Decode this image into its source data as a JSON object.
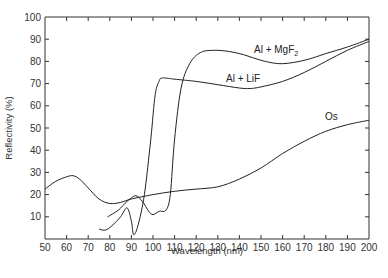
{
  "chart_data": {
    "type": "line",
    "title": "",
    "xlabel": "Wavelength (nm)",
    "ylabel": "Reflectivity (%)",
    "xlim": [
      50,
      200
    ],
    "ylim": [
      0,
      100
    ],
    "xticks": [
      50,
      60,
      70,
      80,
      90,
      100,
      110,
      120,
      130,
      140,
      150,
      160,
      170,
      180,
      190,
      200
    ],
    "yticks": [
      10,
      20,
      30,
      40,
      50,
      60,
      70,
      80,
      90,
      100
    ],
    "grid": false,
    "legend": "inline labels",
    "series": [
      {
        "name": "Al + MgF2",
        "label_text": "Al + MgF",
        "label_subscript": "2",
        "x": [
          79,
          84,
          88,
          92,
          95,
          98,
          100,
          103,
          106,
          108,
          110,
          113,
          117,
          122,
          128,
          135,
          142,
          150,
          158,
          165,
          172,
          180,
          190,
          200
        ],
        "y": [
          10,
          13,
          17,
          19.5,
          17,
          12.5,
          11,
          12.5,
          13,
          20,
          45,
          68,
          79,
          84,
          85,
          84.5,
          83,
          80.5,
          79,
          79.5,
          81,
          83.5,
          86.5,
          90
        ]
      },
      {
        "name": "Al + LiF",
        "label_text": "Al + LiF",
        "x": [
          75,
          78,
          81,
          85,
          88,
          90,
          91,
          93,
          96,
          99,
          101,
          103,
          104,
          106,
          110,
          120,
          130,
          140,
          145,
          150,
          160,
          170,
          180,
          190,
          200
        ],
        "y": [
          4.5,
          4,
          6,
          10,
          14,
          8,
          2,
          6,
          20,
          45,
          65,
          71.5,
          72.5,
          72.5,
          72,
          71,
          69.5,
          68,
          67.8,
          68.5,
          71,
          75,
          80,
          85,
          89
        ]
      },
      {
        "name": "Os",
        "label_text": "Os",
        "x": [
          50,
          55,
          60,
          63,
          66,
          70,
          75,
          80,
          85,
          90,
          100,
          110,
          120,
          130,
          140,
          150,
          160,
          170,
          180,
          190,
          200
        ],
        "y": [
          22.5,
          26,
          28,
          28.5,
          27,
          23,
          18,
          16,
          16.5,
          18,
          20,
          21.5,
          22.5,
          23.5,
          27,
          32,
          38.5,
          44,
          48.5,
          51.5,
          53.5
        ]
      }
    ]
  }
}
